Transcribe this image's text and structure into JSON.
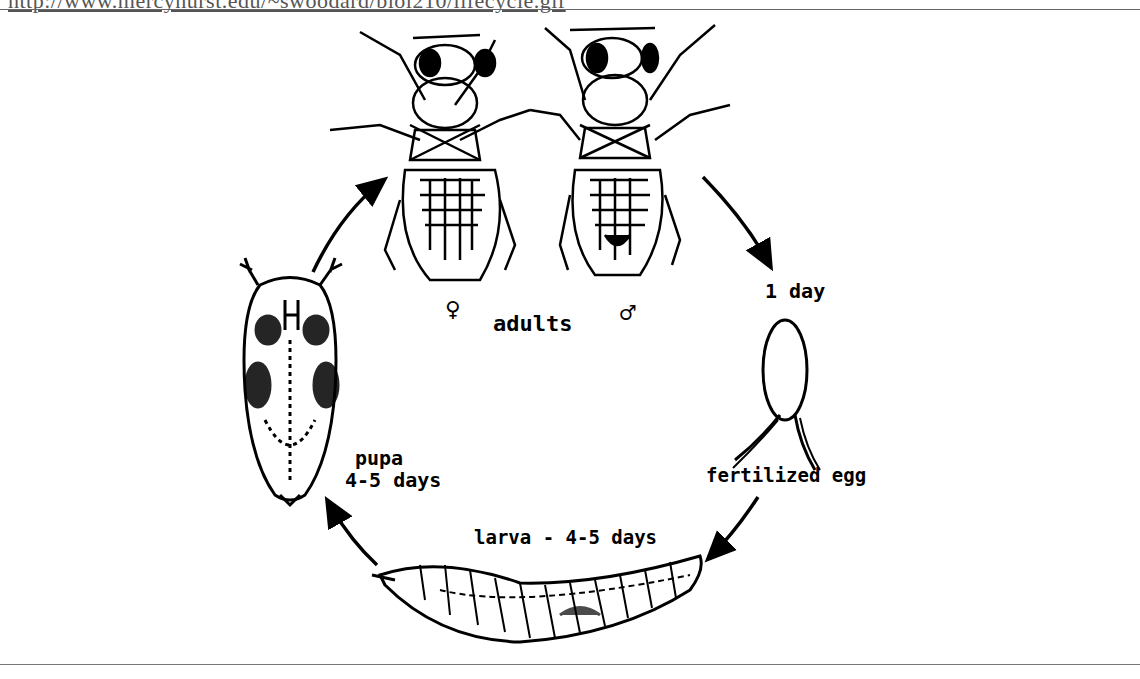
{
  "source_url": "http://www.mercyhurst.edu/~swoodard/biol210/lifecycle.gif",
  "diagram": {
    "stages": {
      "adults": {
        "label": "adults",
        "female_symbol": "♀",
        "male_symbol": "♂"
      },
      "egg": {
        "label": "fertilized egg",
        "duration": "1 day"
      },
      "larva": {
        "label": "larva - 4-5 days"
      },
      "pupa": {
        "label": "pupa",
        "duration": "4-5 days"
      }
    },
    "flow": [
      "adults",
      "fertilized egg",
      "larva",
      "pupa",
      "adults"
    ]
  }
}
